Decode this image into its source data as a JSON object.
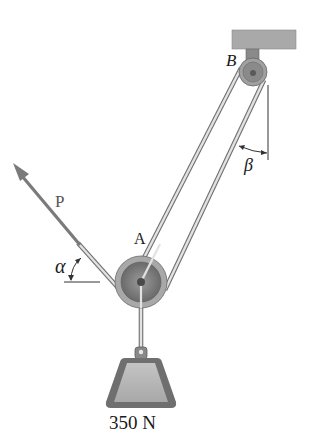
{
  "diagram": {
    "type": "statics-pulley-system",
    "labels": {
      "pulley_a": "A",
      "pulley_b": "B",
      "force": "P",
      "angle_alpha": "α",
      "angle_beta": "β",
      "load": "350 N"
    },
    "colors": {
      "ceiling": "#a9a9a9",
      "pulley": "#8c8c8c",
      "rope": "#d8d8d8",
      "rope_edge": "#6e6e6e",
      "force_arrow": "#7a7a7a",
      "weight_outer": "#6f6f6f",
      "weight_inner": "#b7b7b7"
    }
  }
}
